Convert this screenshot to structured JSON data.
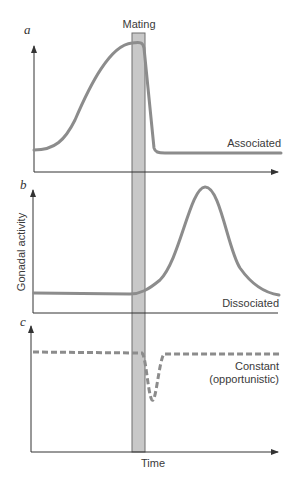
{
  "figure": {
    "mating_label": "Mating",
    "y_axis_label": "Gonadal activity",
    "x_axis_label": "Time",
    "colors": {
      "curve": "#8c8c8c",
      "mating_bar": "#c8c8c8",
      "axis": "#333333"
    },
    "panels": [
      {
        "letter": "a",
        "curve_label": "Associated",
        "line_style": "solid"
      },
      {
        "letter": "b",
        "curve_label": "Dissociated",
        "line_style": "solid"
      },
      {
        "letter": "c",
        "curve_label_line1": "Constant",
        "curve_label_line2": "(opportunistic)",
        "line_style": "dashed"
      }
    ]
  }
}
